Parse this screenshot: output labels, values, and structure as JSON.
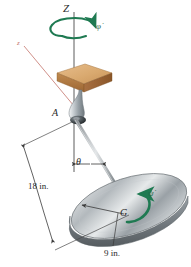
{
  "figure": {
    "background_color": "#ffffff"
  },
  "axes": {
    "fixed_vertical_axis_label": "Z",
    "body_axis_label": "z",
    "body_axis_color": "#c4736b"
  },
  "labels": {
    "point_A": "A",
    "point_G": "G",
    "angle_theta": "θ",
    "precession_rate": "φ̇",
    "spin_rate": "ψ̇"
  },
  "dimensions": {
    "rod_length": "18 in.",
    "disk_radius": "9 in."
  },
  "colors": {
    "motion_arrow_green": "#1f7a52",
    "block_top": "#dba974",
    "block_front": "#b07a44",
    "block_side": "#93602f",
    "metal_light": "#e2e4e6",
    "metal_mid": "#a9aeb2",
    "metal_dark": "#6d7376",
    "line_dark": "#3a3a3a"
  },
  "icons": {
    "precession_arrow": "circular-arrow-icon",
    "spin_arrow": "curved-arrow-icon",
    "angle_arrow": "double-headed-arrow-icon",
    "dimension_arrow": "dimension-arrow-icon",
    "radius_arrow": "radius-arrow-icon"
  }
}
